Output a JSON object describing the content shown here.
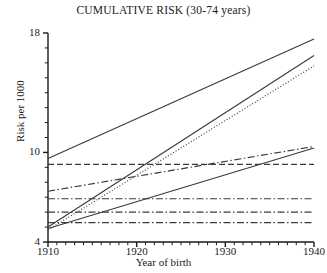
{
  "chart_data": {
    "type": "line",
    "title": "CUMULATIVE RISK (30-74 years)",
    "xlabel": "Year of birth",
    "ylabel": "Risk per 1000",
    "xlim": [
      1910,
      1940
    ],
    "ylim": [
      4,
      18
    ],
    "xticks": [
      1910,
      1920,
      1930,
      1940
    ],
    "xtick_labels": [
      "1910",
      "1920",
      "1930",
      "1940"
    ],
    "yticks": [
      4,
      10,
      18
    ],
    "ytick_labels": [
      "4",
      "10",
      "18"
    ],
    "xminor_step": 1,
    "yminor_step": 1,
    "grid": false,
    "legend": "none",
    "x": [
      1910,
      1940
    ],
    "series": [
      {
        "name": "series-1",
        "style": "solid",
        "values": [
          9.6,
          17.6
        ]
      },
      {
        "name": "series-2",
        "style": "solid",
        "values": [
          5.0,
          16.5
        ]
      },
      {
        "name": "series-3",
        "style": "dotted",
        "values": [
          4.8,
          15.8
        ]
      },
      {
        "name": "series-4",
        "style": "dashdot",
        "values": [
          7.4,
          10.4
        ]
      },
      {
        "name": "series-5",
        "style": "solid",
        "values": [
          4.9,
          10.3
        ]
      },
      {
        "name": "series-6",
        "style": "dashed",
        "values": [
          9.2,
          9.2
        ]
      },
      {
        "name": "series-7",
        "style": "dashdot",
        "values": [
          6.9,
          6.9
        ]
      },
      {
        "name": "series-8",
        "style": "dashdot",
        "values": [
          6.0,
          6.0
        ]
      },
      {
        "name": "series-9",
        "style": "dashdot",
        "values": [
          5.3,
          5.3
        ]
      }
    ]
  },
  "colors": {
    "axis": "#1a1a1a",
    "line": "#3a3a3a",
    "background": "#ffffff"
  }
}
